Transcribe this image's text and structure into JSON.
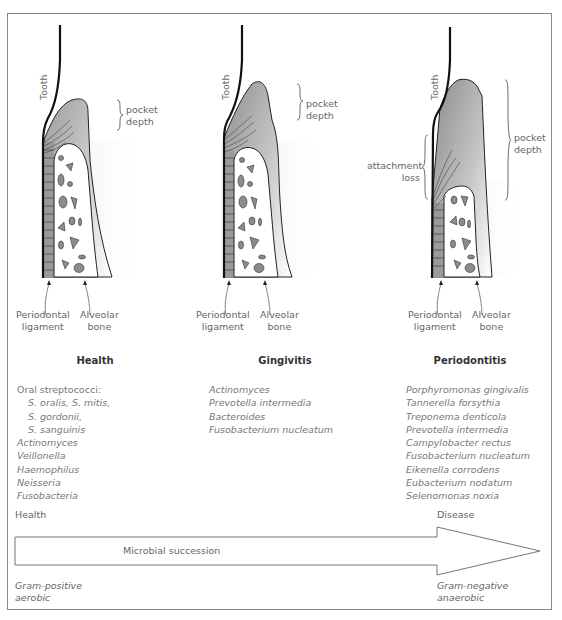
{
  "figure": {
    "panels": [
      {
        "title": "Health",
        "tooth_label": "Tooth",
        "pocket_label": [
          "pocket",
          "depth"
        ],
        "ligament_label": [
          "Periodontal",
          "ligament"
        ],
        "bone_label": [
          "Alveolar",
          "bone"
        ],
        "bacteria_header": "Oral streptococci:",
        "bacteria_sub": [
          "S. oralis, S. mitis,",
          "S. gordonii,",
          "S. sanguinis"
        ],
        "bacteria": [
          "Actinomyces",
          "Veillonella",
          "Haemophilus",
          "Neisseria",
          "Fusobacteria"
        ]
      },
      {
        "title": "Gingivitis",
        "tooth_label": "Tooth",
        "pocket_label": [
          "pocket",
          "depth"
        ],
        "ligament_label": [
          "Periodontal",
          "ligament"
        ],
        "bone_label": [
          "Alveolar",
          "bone"
        ],
        "bacteria": [
          "Actinomyces",
          "Prevotella intermedia",
          "Bacteroides",
          "Fusobacterium nucleatum"
        ]
      },
      {
        "title": "Periodontitis",
        "tooth_label": "Tooth",
        "pocket_label": [
          "pocket",
          "depth"
        ],
        "attachment_label": [
          "attachment",
          "loss"
        ],
        "ligament_label": [
          "Periodontal",
          "ligament"
        ],
        "bone_label": [
          "Alveolar",
          "bone"
        ],
        "bacteria": [
          "Porphyromonas gingivalis",
          "Tannerella forsythia",
          "Treponema denticola",
          "Prevotella intermedia",
          "Campylobacter rectus",
          "Fusobacterium nucleatum",
          "Eikenella corrodens",
          "Eubacterium nodatum",
          "Selenomonas noxia"
        ]
      }
    ],
    "succession": {
      "start_label": "Health",
      "end_label": "Disease",
      "arrow_label": "Microbial succession",
      "start_type": [
        "Gram-positive",
        "aerobic"
      ],
      "end_type": [
        "Gram-negative",
        "anaerobic"
      ]
    },
    "colors": {
      "frame": "#8a8a8a",
      "gum": "#a8a8a8",
      "bone_particle": "#8c8c8c",
      "tooth_line": "#111111"
    }
  }
}
